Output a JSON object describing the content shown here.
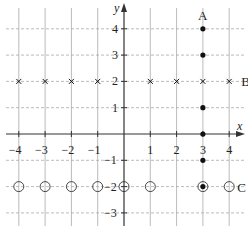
{
  "chart_data": {
    "type": "scatter",
    "title": "",
    "xlabel": "x",
    "ylabel": "y",
    "xlim": [
      -4.5,
      4.5
    ],
    "ylim": [
      -3.5,
      4.5
    ],
    "grid": true,
    "x_ticks": [
      -4,
      -3,
      -2,
      -1,
      1,
      2,
      3,
      4
    ],
    "y_ticks": [
      4,
      3,
      2,
      1,
      -1,
      -2,
      -3
    ],
    "series": [
      {
        "name": "A",
        "marker": "filled-dot",
        "points": [
          [
            3,
            4
          ],
          [
            3,
            3
          ],
          [
            3,
            1
          ],
          [
            3,
            0
          ],
          [
            3,
            -1
          ],
          [
            3,
            -2
          ]
        ]
      },
      {
        "name": "B",
        "marker": "cross",
        "points": [
          [
            -4,
            2
          ],
          [
            -3,
            2
          ],
          [
            -2,
            2
          ],
          [
            -1,
            2
          ],
          [
            1,
            2
          ],
          [
            2,
            2
          ],
          [
            3,
            2
          ],
          [
            4,
            2
          ]
        ]
      },
      {
        "name": "C",
        "marker": "open-circle",
        "points": [
          [
            -4,
            -2
          ],
          [
            -3,
            -2
          ],
          [
            -2,
            -2
          ],
          [
            -1,
            -2
          ],
          [
            0,
            -2
          ],
          [
            1,
            -2
          ],
          [
            3,
            -2
          ],
          [
            4,
            -2
          ]
        ]
      }
    ],
    "annotations": [
      {
        "text": "A",
        "at": [
          3,
          4.5
        ]
      },
      {
        "text": "B",
        "at": [
          4.4,
          2
        ]
      },
      {
        "text": "C",
        "at": [
          4.4,
          -2
        ]
      }
    ]
  },
  "labels": {
    "x_axis": "x",
    "y_axis": "y",
    "A": "A",
    "B": "B",
    "C": "C"
  },
  "colors": {
    "grid": "#aaaaaa",
    "axis": "#333333",
    "marker": "#111111"
  }
}
